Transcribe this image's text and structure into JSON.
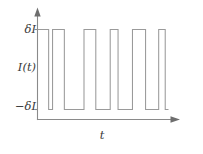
{
  "figure": {
    "caption_present": false,
    "background_color": "#ffffff",
    "line_color": "#9a9a9a",
    "axis_color": "#8a8a8a",
    "text_color": "#3a3a3a"
  },
  "labels": {
    "y_upper": "δI",
    "y_middle": "I(t)",
    "y_lower": "−δI",
    "x_axis": "t"
  },
  "chart_data": {
    "type": "line",
    "title": "",
    "xlabel": "t",
    "ylabel": "I(t)",
    "subtitle": "",
    "grid": false,
    "legend": null,
    "legend_position": "none",
    "style": "step-post",
    "ytick_labels": [
      "δI",
      "−δI"
    ],
    "ytick_values": [
      1,
      -1
    ],
    "ylim": [
      -1.45,
      1.45
    ],
    "xlim": [
      0,
      100
    ],
    "xtick_labels": [],
    "series": [
      {
        "name": "I(t)",
        "color": "#9a9a9a",
        "x": [
          0,
          8.5,
          11.5,
          20.5,
          35.5,
          44.5,
          55.5,
          61.5,
          72.5,
          82.5,
          92.5,
          97.5,
          100
        ],
        "values": [
          1,
          -1,
          1,
          -1,
          1,
          -1,
          1,
          -1,
          1,
          -1,
          1,
          -1,
          -1
        ],
        "segments": [
          {
            "level": 1,
            "x_start": 0,
            "x_end": 8.5
          },
          {
            "level": -1,
            "x_start": 8.5,
            "x_end": 11.5
          },
          {
            "level": 1,
            "x_start": 11.5,
            "x_end": 20.5
          },
          {
            "level": -1,
            "x_start": 20.5,
            "x_end": 35.5
          },
          {
            "level": 1,
            "x_start": 35.5,
            "x_end": 44.5
          },
          {
            "level": -1,
            "x_start": 44.5,
            "x_end": 55.5
          },
          {
            "level": 1,
            "x_start": 55.5,
            "x_end": 61.5
          },
          {
            "level": -1,
            "x_start": 61.5,
            "x_end": 72.5
          },
          {
            "level": 1,
            "x_start": 72.5,
            "x_end": 82.5
          },
          {
            "level": -1,
            "x_start": 82.5,
            "x_end": 92.5
          },
          {
            "level": 1,
            "x_start": 92.5,
            "x_end": 97.5
          },
          {
            "level": -1,
            "x_start": 97.5,
            "x_end": 100
          }
        ]
      }
    ]
  }
}
